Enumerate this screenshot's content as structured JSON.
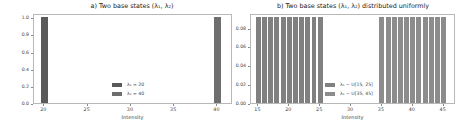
{
  "chart_data": [
    {
      "type": "bar",
      "title": "a) Two base states (λ₁, λ₂)",
      "xlabel": "Intensity",
      "ylabel": "",
      "xlim": [
        18.8,
        41.8
      ],
      "ylim": [
        0.0,
        1.05
      ],
      "xticks": [
        20,
        25,
        30,
        35,
        40
      ],
      "yticks": [
        0.0,
        0.2,
        0.4,
        0.6,
        0.8,
        1.0
      ],
      "ytick_labels": [
        "0.0",
        "0.2",
        "0.4",
        "0.6",
        "0.8",
        "1.0"
      ],
      "grid": false,
      "legend_position": "lower center",
      "series": [
        {
          "name": "λ₁ = 20",
          "color": "#5a5a5a",
          "x": [
            20
          ],
          "values": [
            1.0
          ],
          "bar_width": 0.8
        },
        {
          "name": "λ₁ = 40",
          "color": "#6e6e6e",
          "x": [
            40
          ],
          "values": [
            1.0
          ],
          "bar_width": 0.8
        }
      ]
    },
    {
      "type": "bar",
      "title": "b) Two base states (λ₁, λ₂) distributed uniformly",
      "xlabel": "Intensity",
      "ylabel": "",
      "xlim": [
        13.8,
        47.0
      ],
      "ylim": [
        0.0,
        0.0955
      ],
      "xticks": [
        15,
        20,
        25,
        30,
        35,
        40,
        45
      ],
      "yticks": [
        0.0,
        0.02,
        0.04,
        0.06,
        0.08
      ],
      "ytick_labels": [
        "0.00",
        "0.02",
        "0.04",
        "0.06",
        "0.08"
      ],
      "grid": false,
      "legend_position": "lower center",
      "series": [
        {
          "name": "λ₁ ~ U[15, 25]",
          "color": "#808080",
          "x": [
            15,
            16,
            17,
            18,
            19,
            20,
            21,
            22,
            23,
            24,
            25
          ],
          "values": [
            0.0909,
            0.0909,
            0.0909,
            0.0909,
            0.0909,
            0.0909,
            0.0909,
            0.0909,
            0.0909,
            0.0909,
            0.0909
          ],
          "bar_width": 0.8
        },
        {
          "name": "λ₁ ~ U[35, 45]",
          "color": "#8c8c8c",
          "x": [
            35,
            36,
            37,
            38,
            39,
            40,
            41,
            42,
            43,
            44,
            45
          ],
          "values": [
            0.0909,
            0.0909,
            0.0909,
            0.0909,
            0.0909,
            0.0909,
            0.0909,
            0.0909,
            0.0909,
            0.0909,
            0.0909
          ],
          "bar_width": 0.8
        }
      ]
    }
  ],
  "panels": {
    "a": {
      "title": "a) Two base states (λ₁, λ₂)",
      "xlabel": "Intensity",
      "legend": [
        "λ₁ = 20",
        "λ₁ = 40"
      ]
    },
    "b": {
      "title": "b) Two base states (λ₁, λ₂) distributed uniformly",
      "xlabel": "Intensity",
      "legend": [
        "λ₁ ~ U[15, 25]",
        "λ₁ ~ U[35, 45]"
      ]
    }
  }
}
